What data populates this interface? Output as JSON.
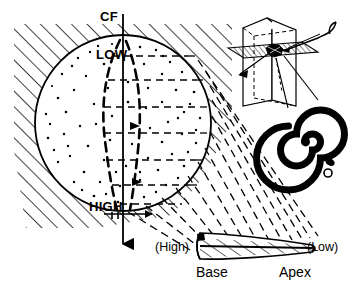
{
  "figure": {
    "title_visible": false,
    "background_color": "#ffffff",
    "ink_color": "#000000",
    "width": 350,
    "height": 289
  },
  "sphere_panel": {
    "name": "tonotopic-sphere",
    "axis_label": "CF",
    "axis_top_label": "CF",
    "gradient_labels": {
      "top": "LOW",
      "bottom": "HIGH"
    },
    "hatching": "diagonal",
    "interior_fill": "stipple-dots",
    "circle_center_x": 123,
    "circle_center_y": 123,
    "circle_radius": 88
  },
  "head_inset": {
    "name": "head-block-inset",
    "shape": "3d-box",
    "plane": "hatched-horizontal-slice",
    "marker": "dark-blob",
    "pointer": "curved-arrow"
  },
  "cochlea_inset": {
    "name": "cochlea-spiral",
    "shape": "spiral",
    "turns": 2.5,
    "round_window": "small-circle",
    "oval_window": "small-oval"
  },
  "cochlea_unrolled": {
    "name": "unrolled-cochlea-tube",
    "left_label": "(High)",
    "right_label": "(Low)",
    "base_label": "Base",
    "apex_label": "Apex",
    "hatching": "diagonal"
  },
  "projection": {
    "name": "projection-fan",
    "style": "dashed",
    "line_count": 13
  },
  "labels": {
    "cf": "CF",
    "low": "LOW",
    "high": "HIGH",
    "high_paren": "(High)",
    "low_paren": "(Low)",
    "base": "Base",
    "apex": "Apex"
  },
  "colors": {
    "ink": "#000000",
    "paper": "#ffffff"
  }
}
